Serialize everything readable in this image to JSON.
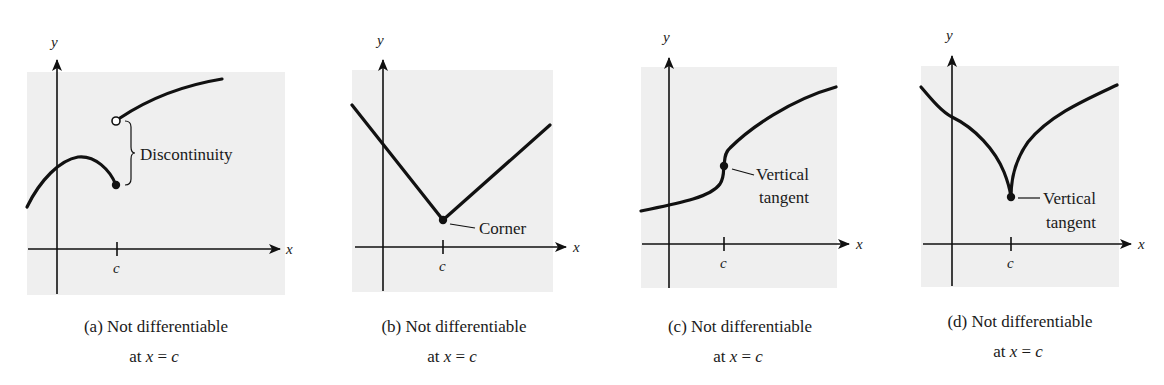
{
  "figure": {
    "colors": {
      "plot_background": "#efefef",
      "curve": "#111111",
      "page_background": "#ffffff"
    },
    "panels": [
      {
        "id": "a",
        "axis_labels": {
          "x": "x",
          "y": "y"
        },
        "tick_label": "c",
        "annotation": "Discontinuity",
        "caption_line1": "(a) Not differentiable",
        "caption_line2_prefix": "at ",
        "caption_line2_var": "x",
        "caption_line2_eq": " = ",
        "caption_line2_val": "c",
        "feature": "jump discontinuity at x = c (open circle above, filled dot below)"
      },
      {
        "id": "b",
        "axis_labels": {
          "x": "x",
          "y": "y"
        },
        "tick_label": "c",
        "annotation": "Corner",
        "caption_line1": "(b) Not differentiable",
        "caption_line2_prefix": "at ",
        "caption_line2_var": "x",
        "caption_line2_eq": " = ",
        "caption_line2_val": "c",
        "feature": "V-shaped corner at x = c"
      },
      {
        "id": "c",
        "axis_labels": {
          "x": "x",
          "y": "y"
        },
        "tick_label": "c",
        "annotation_line1": "Vertical",
        "annotation_line2": "tangent",
        "caption_line1": "(c) Not differentiable",
        "caption_line2_prefix": "at ",
        "caption_line2_var": "x",
        "caption_line2_eq": " = ",
        "caption_line2_val": "c",
        "feature": "inflection with vertical tangent at x = c"
      },
      {
        "id": "d",
        "axis_labels": {
          "x": "x",
          "y": "y"
        },
        "tick_label": "c",
        "annotation_line1": "Vertical",
        "annotation_line2": "tangent",
        "caption_line1": "(d) Not differentiable",
        "caption_line2_prefix": "at ",
        "caption_line2_var": "x",
        "caption_line2_eq": " = ",
        "caption_line2_val": "c",
        "feature": "cusp with vertical tangent at x = c"
      }
    ]
  }
}
